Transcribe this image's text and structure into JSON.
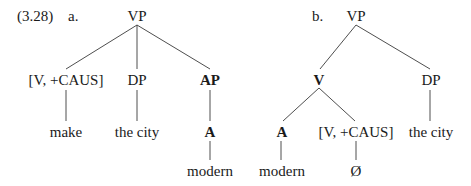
{
  "example_number": "(3.28)",
  "trees": [
    {
      "label": "a.",
      "nodes": {
        "root": "VP",
        "v_caus": "[V, +CAUS]",
        "dp": "DP",
        "ap": "AP",
        "make": "make",
        "the_city": "the city",
        "a": "A",
        "modern": "modern"
      }
    },
    {
      "label": "b.",
      "nodes": {
        "root": "VP",
        "v": "V",
        "dp": "DP",
        "a": "A",
        "v_caus": "[V, +CAUS]",
        "the_city": "the city",
        "modern": "modern",
        "null": "Ø"
      }
    }
  ]
}
